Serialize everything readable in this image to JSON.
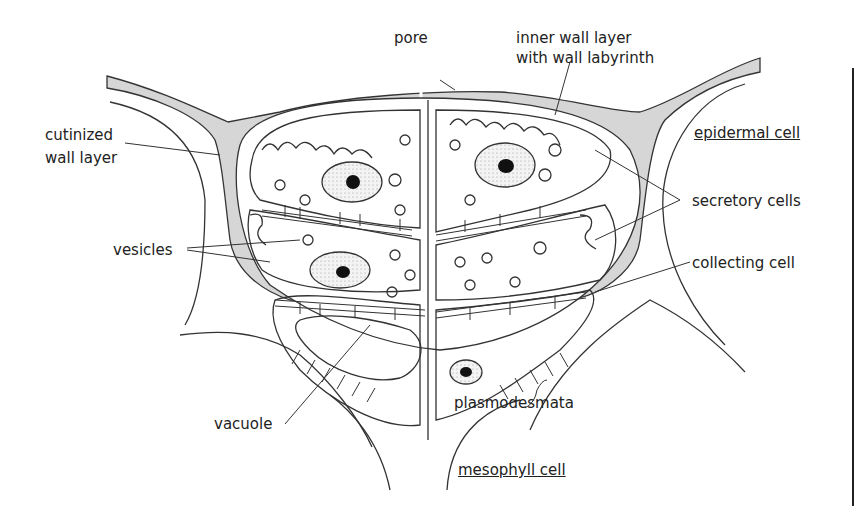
{
  "diagram": {
    "labels": {
      "pore": "pore",
      "inner_wall": "inner wall layer",
      "inner_wall_2": "with wall  labyrinth",
      "cutinized": "cutinized",
      "cutinized_2": "wall layer",
      "epidermal": "epidermal cell",
      "secretory": "secretory cells",
      "vesicles": "vesicles",
      "collecting": "collecting cell",
      "plasmodesmata": "plasmodesmata",
      "vacuole": "vacuole",
      "mesophyll": "mesophyll cell"
    },
    "colors": {
      "line": "#333333",
      "wall_fill": "#d6d6d6",
      "nucleus": "#111111",
      "stipple": "#eeeeee"
    }
  }
}
